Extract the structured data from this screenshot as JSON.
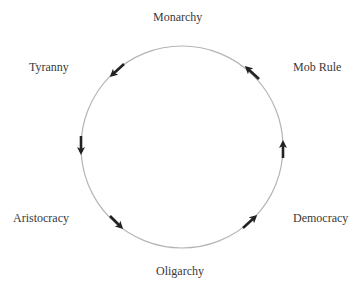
{
  "diagram": {
    "type": "cycle",
    "title": "",
    "nodes": [
      {
        "id": "monarchy",
        "label": "Monarchy"
      },
      {
        "id": "tyranny",
        "label": "Tyranny"
      },
      {
        "id": "aristocracy",
        "label": "Aristocracy"
      },
      {
        "id": "oligarchy",
        "label": "Oligarchy"
      },
      {
        "id": "democracy",
        "label": "Democracy"
      },
      {
        "id": "mob_rule",
        "label": "Mob Rule"
      }
    ],
    "direction": "counter-clockwise",
    "edges": [
      {
        "from": "Monarchy",
        "to": "Tyranny"
      },
      {
        "from": "Tyranny",
        "to": "Aristocracy"
      },
      {
        "from": "Aristocracy",
        "to": "Oligarchy"
      },
      {
        "from": "Oligarchy",
        "to": "Democracy"
      },
      {
        "from": "Democracy",
        "to": "Mob Rule"
      },
      {
        "from": "Mob Rule",
        "to": "Monarchy"
      }
    ],
    "colors": {
      "circle": "#b5b5b5",
      "arrow": "#222222",
      "text": "#3a3a3a"
    }
  }
}
